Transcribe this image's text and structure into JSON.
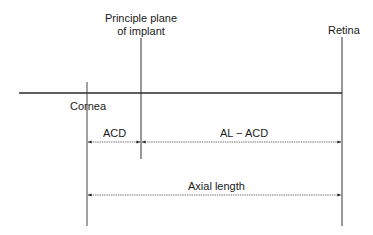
{
  "diagram": {
    "type": "optical-schematic",
    "labels": {
      "implant_plane_line1": "Principle plane",
      "implant_plane_line2": "of implant",
      "retina": "Retina",
      "cornea": "Cornea",
      "acd": "ACD",
      "al_minus_acd": "AL − ACD",
      "axial_length": "Axial length"
    },
    "elements": [
      {
        "name": "optical-axis",
        "kind": "horizontal-line"
      },
      {
        "name": "cornea-plane",
        "kind": "vertical-line"
      },
      {
        "name": "implant-principal-plane",
        "kind": "vertical-line"
      },
      {
        "name": "retina-plane",
        "kind": "vertical-line"
      }
    ],
    "dimensions": [
      {
        "label": "ACD",
        "from": "cornea-plane",
        "to": "implant-principal-plane"
      },
      {
        "label": "AL − ACD",
        "from": "implant-principal-plane",
        "to": "retina-plane"
      },
      {
        "label": "Axial length",
        "from": "cornea-plane",
        "to": "retina-plane"
      }
    ],
    "colors": {
      "line": "#2a2a2a",
      "background": "#ffffff"
    }
  }
}
